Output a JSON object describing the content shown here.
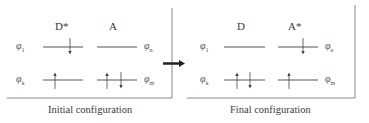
{
  "panels": [
    {
      "caption": "Initial configuration",
      "donor_label": "D*",
      "acceptor_label": "A",
      "orbitals": {
        "upper_left": "1",
        "upper_right": "n",
        "lower_left": "k",
        "lower_right": "m",
        "symbol": "φ"
      },
      "electrons": {
        "donor_upper": [
          "down"
        ],
        "donor_lower": [
          "up"
        ],
        "acceptor_upper": [],
        "acceptor_lower": [
          "up",
          "down"
        ]
      }
    },
    {
      "caption": "Final configuration",
      "donor_label": "D",
      "acceptor_label": "A*",
      "orbitals": {
        "upper_left": "1",
        "upper_right": "n",
        "lower_left": "k",
        "lower_right": "m",
        "symbol": "φ"
      },
      "electrons": {
        "donor_upper": [],
        "donor_lower": [
          "up",
          "down"
        ],
        "acceptor_upper": [
          "down"
        ],
        "acceptor_lower": [
          "up"
        ]
      }
    }
  ],
  "transition_arrow": "right-arrow",
  "colors": {
    "line": "#555555",
    "arrow": "#222222",
    "frame": "#888888"
  }
}
